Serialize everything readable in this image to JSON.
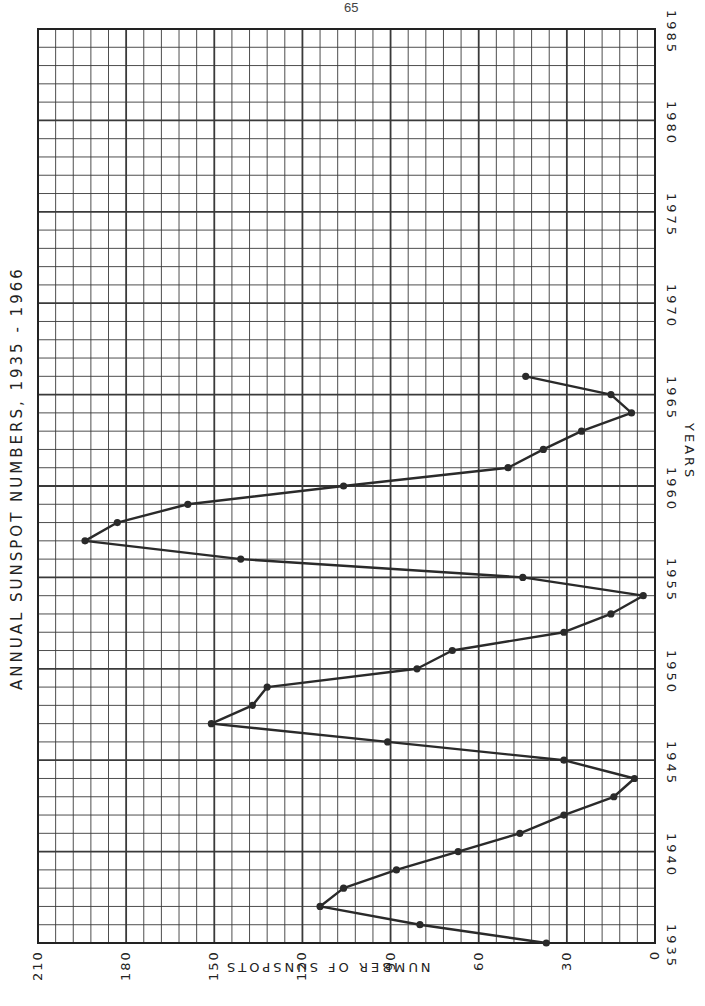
{
  "page": {
    "page_number": "65"
  },
  "chart_data": {
    "type": "line",
    "title": "ANNUAL SUNSPOT NUMBERS, 1935 - 1966",
    "xlabel": "YEARS",
    "ylabel": "NUMBER OF SUNSPOTS",
    "orientation": "rotated 90° — years run bottom-to-top along right edge, sunspot count runs right-to-left along bottom edge",
    "x": [
      1935,
      1936,
      1937,
      1938,
      1939,
      1940,
      1941,
      1942,
      1943,
      1944,
      1945,
      1946,
      1947,
      1948,
      1949,
      1950,
      1951,
      1952,
      1953,
      1954,
      1955,
      1956,
      1957,
      1958,
      1959,
      1960,
      1961,
      1962,
      1963,
      1964,
      1965,
      1966
    ],
    "series": [
      {
        "name": "Annual sunspot number",
        "values": [
          37,
          80,
          114,
          106,
          88,
          67,
          46,
          31,
          14,
          7,
          31,
          91,
          151,
          137,
          132,
          81,
          69,
          31,
          15,
          4,
          45,
          141,
          194,
          183,
          159,
          106,
          50,
          38,
          25,
          8,
          15,
          44
        ],
        "color": "#2a2a2a",
        "marker": "circle"
      }
    ],
    "xlim": [
      1935,
      1985
    ],
    "ylim": [
      0,
      210
    ],
    "x_ticks": [
      "1935",
      "1940",
      "1945",
      "1950",
      "1955",
      "1960",
      "1965",
      "1970",
      "1975",
      "1980",
      "1985"
    ],
    "y_ticks": [
      "210",
      "180",
      "150",
      "120",
      "90",
      "60",
      "30",
      "0"
    ],
    "grid": true,
    "grid_minor_x_step_years": 1,
    "grid_minor_y_step": 6,
    "legend": "none"
  },
  "style": {
    "grid_color": "#3a3a3a",
    "line_color": "#2a2a2a",
    "background": "#ffffff"
  }
}
